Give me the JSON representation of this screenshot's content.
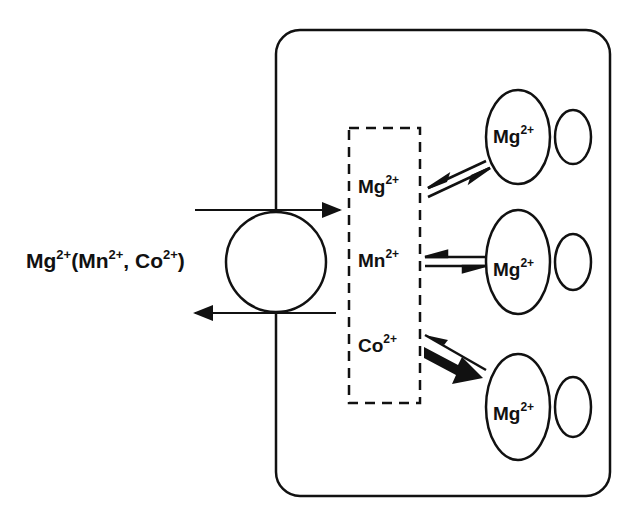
{
  "diagram": {
    "type": "cell ion transport schematic",
    "external_label": {
      "base": "Mg",
      "sup1": "2+",
      "paren_open": "(Mn",
      "sup2": "2+",
      "comma": ", Co",
      "sup3": "2+",
      "paren_close": ")"
    },
    "pool_ions": [
      {
        "base": "Mg",
        "sup": "2+"
      },
      {
        "base": "Mn",
        "sup": "2+"
      },
      {
        "base": "Co",
        "sup": "2+"
      }
    ],
    "binding_sites": [
      {
        "base": "Mg",
        "sup": "2+",
        "equilibrium": "balanced"
      },
      {
        "base": "Mg",
        "sup": "2+",
        "equilibrium": "balanced"
      },
      {
        "base": "Mg",
        "sup": "2+",
        "equilibrium": "favors-forward"
      }
    ],
    "colors": {
      "stroke": "#111111",
      "background": "#ffffff"
    }
  }
}
